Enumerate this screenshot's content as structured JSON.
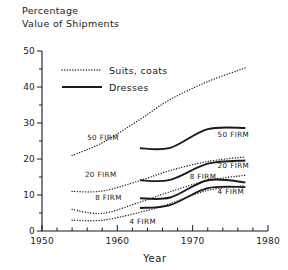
{
  "chart_data": {
    "type": "line",
    "title": "",
    "ylabel_lines": [
      "Percentage",
      "Value of Shipments"
    ],
    "xlabel": "Year",
    "xlim": [
      1950,
      1980
    ],
    "ylim": [
      0,
      50
    ],
    "xticks": [
      1950,
      1960,
      1970,
      1980
    ],
    "xtick_labels": [
      "1950",
      "1960",
      "1970",
      "1980"
    ],
    "xminor_step": 2,
    "yticks": [
      0,
      10,
      20,
      30,
      40,
      50
    ],
    "ytick_labels": [
      "0",
      "10",
      "20",
      "30",
      "40",
      "50"
    ],
    "yminor_step": 5,
    "grid": false,
    "legend": {
      "position": "upper-left-inside",
      "entries": [
        {
          "label": "Suits, coats",
          "style": "dotted"
        },
        {
          "label": "Dresses",
          "style": "solid"
        }
      ]
    },
    "series": [
      {
        "name": "Suits, coats — 50 FIRM",
        "product": "Suits, coats",
        "concentration": "50 FIRM",
        "style": "dotted",
        "x": [
          1954,
          1958,
          1963,
          1967,
          1972,
          1977
        ],
        "y": [
          21.0,
          24.5,
          31.0,
          36.5,
          41.5,
          45.3
        ]
      },
      {
        "name": "Suits, coats — 20 FIRM",
        "product": "Suits, coats",
        "concentration": "20 FIRM",
        "style": "dotted",
        "x": [
          1954,
          1958,
          1963,
          1967,
          1972,
          1977
        ],
        "y": [
          11.0,
          11.1,
          14.0,
          16.8,
          19.3,
          20.6
        ]
      },
      {
        "name": "Suits, coats — 8 FIRM",
        "product": "Suits, coats",
        "concentration": "8 FIRM",
        "style": "dotted",
        "x": [
          1954,
          1958,
          1963,
          1967,
          1972,
          1977
        ],
        "y": [
          6.0,
          4.9,
          8.0,
          10.9,
          14.0,
          15.5
        ]
      },
      {
        "name": "Suits, coats — 4 FIRM",
        "product": "Suits, coats",
        "concentration": "4 FIRM",
        "style": "dotted",
        "x": [
          1954,
          1958,
          1963,
          1967,
          1972,
          1977
        ],
        "y": [
          3.0,
          3.0,
          5.2,
          7.6,
          11.3,
          12.6
        ]
      },
      {
        "name": "Dresses — 50 FIRM",
        "product": "Dresses",
        "concentration": "50 FIRM",
        "style": "solid",
        "x": [
          1963,
          1967,
          1972,
          1977
        ],
        "y": [
          23.0,
          23.1,
          28.3,
          28.6
        ]
      },
      {
        "name": "Dresses — 20 FIRM",
        "product": "Dresses",
        "concentration": "20 FIRM",
        "style": "solid",
        "x": [
          1963,
          1967,
          1972,
          1977
        ],
        "y": [
          14.1,
          14.2,
          18.7,
          19.6
        ]
      },
      {
        "name": "Dresses — 8 FIRM",
        "product": "Dresses",
        "concentration": "8 FIRM",
        "style": "solid",
        "x": [
          1963,
          1967,
          1972,
          1977
        ],
        "y": [
          9.1,
          9.3,
          14.1,
          13.5
        ]
      },
      {
        "name": "Dresses — 4 FIRM",
        "product": "Dresses",
        "concentration": "4 FIRM",
        "style": "solid",
        "x": [
          1963,
          1967,
          1972,
          1977
        ],
        "y": [
          6.4,
          7.2,
          11.9,
          12.2
        ]
      }
    ],
    "annotations": [
      {
        "text": "50 FIRM",
        "x": 1960.2,
        "y": 25.3,
        "anchor": "end"
      },
      {
        "text": "20 FIRM",
        "x": 1959.9,
        "y": 15.0,
        "anchor": "end"
      },
      {
        "text": "8 FIRM",
        "x": 1960.6,
        "y": 8.6,
        "anchor": "end"
      },
      {
        "text": "4 FIRM",
        "x": 1961.6,
        "y": 1.9,
        "anchor": "start"
      },
      {
        "text": "50 FIRM",
        "x": 1973.3,
        "y": 26.0,
        "anchor": "start"
      },
      {
        "text": "20 FIRM",
        "x": 1973.3,
        "y": 17.4,
        "anchor": "start"
      },
      {
        "text": "8 FIRM",
        "x": 1969.6,
        "y": 14.5,
        "anchor": "start"
      },
      {
        "text": "4 FIRM",
        "x": 1973.3,
        "y": 10.3,
        "anchor": "start"
      }
    ]
  }
}
